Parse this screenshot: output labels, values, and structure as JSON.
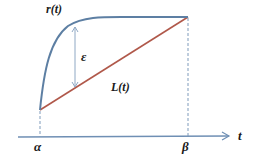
{
  "diagram": {
    "labels": {
      "curve": "r(t)",
      "line": "L(t)",
      "gap": "ε",
      "axis": "t",
      "start": "α",
      "end": "β"
    },
    "colors": {
      "curve": "#5d7fa3",
      "line": "#b0584a",
      "gap_arrow": "#8fa8c4",
      "axis": "#6f8fb4",
      "dashed": "#7f9bbb",
      "text": "#1a1a1a"
    }
  }
}
